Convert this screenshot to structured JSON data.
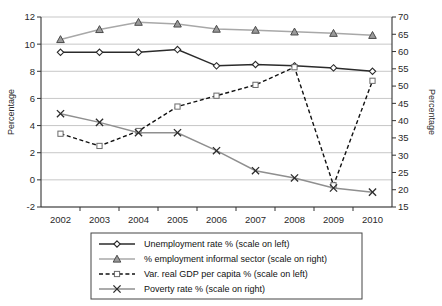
{
  "chart_data": {
    "type": "line",
    "title": "",
    "xlabel": "",
    "ylabel": "Percentage",
    "ylabel_right": "Percentage",
    "categories": [
      "2002",
      "2003",
      "2004",
      "2005",
      "2006",
      "2007",
      "2008",
      "2009",
      "2010"
    ],
    "x": [
      2002,
      2003,
      2004,
      2005,
      2006,
      2007,
      2008,
      2009,
      2010
    ],
    "ylim": [
      -2,
      12
    ],
    "ylim_right": [
      15,
      70
    ],
    "yticks": [
      -2,
      0,
      2,
      4,
      6,
      8,
      10,
      12
    ],
    "yticks_right": [
      15,
      20,
      25,
      30,
      35,
      40,
      45,
      50,
      55,
      60,
      65,
      70
    ],
    "grid": true,
    "legend_position": "bottom",
    "series": [
      {
        "name": "Unemployment rate % (scale on left)",
        "axis": "left",
        "marker": "diamond",
        "linestyle": "solid",
        "color": "#2b2b2b",
        "values": [
          9.4,
          9.4,
          9.4,
          9.6,
          8.4,
          8.5,
          8.4,
          8.25,
          8.0
        ]
      },
      {
        "name": "% employment informal sector (scale on right)",
        "axis": "right",
        "marker": "triangle",
        "linestyle": "solid",
        "color": "#a8a8a8",
        "values": [
          63.5,
          66.4,
          68.5,
          68.0,
          66.5,
          66.2,
          65.7,
          65.3,
          64.7
        ]
      },
      {
        "name": "Var. real GDP per capita % (scale on left)",
        "axis": "left",
        "marker": "square",
        "linestyle": "dashed",
        "color": "#111111",
        "values": [
          3.4,
          2.5,
          3.6,
          5.4,
          6.2,
          7.0,
          8.3,
          -0.4,
          7.3
        ]
      },
      {
        "name": "Poverty rate % (scale on right)",
        "axis": "right",
        "marker": "x",
        "linestyle": "solid",
        "color": "#8f8f8f",
        "values": [
          42.0,
          39.5,
          36.5,
          36.5,
          31.3,
          25.5,
          23.4,
          20.5,
          19.3
        ]
      }
    ]
  },
  "legend": {
    "items": [
      {
        "label": "Unemployment rate % (scale on left)"
      },
      {
        "label": "% employment informal sector (scale on right)"
      },
      {
        "label": "Var. real GDP per capita % (scale on left)"
      },
      {
        "label": "Poverty rate % (scale on right)"
      }
    ]
  },
  "axes": {
    "left_title": "Percentage",
    "right_title": "Percentage"
  }
}
